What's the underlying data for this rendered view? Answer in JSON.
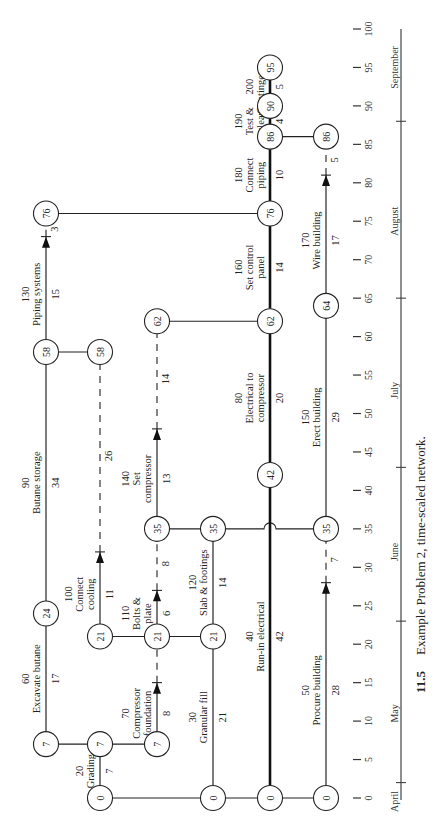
{
  "figure": {
    "number": "11.5",
    "caption": "Example Problem 2, time-scaled network.",
    "orientation": "rotated -90 degrees (reads bottom-to-top)"
  },
  "time_axis": {
    "ticks": [
      0,
      5,
      10,
      15,
      20,
      25,
      30,
      35,
      40,
      45,
      50,
      55,
      60,
      65,
      70,
      75,
      80,
      85,
      90,
      95,
      100
    ],
    "months": [
      {
        "label": "April",
        "tick_at": 2
      },
      {
        "label": "May",
        "tick_at": 23
      },
      {
        "label": "June",
        "tick_at": 43
      },
      {
        "label": "July",
        "tick_at": 65
      },
      {
        "label": "August",
        "tick_at": 88
      },
      {
        "label": "September",
        "tick_at": null
      }
    ],
    "month_label_positions": {
      "April": 0,
      "May": 11,
      "June": 32,
      "July": 53,
      "August": 75,
      "September": 95
    }
  },
  "rows": {
    "A": 46,
    "B": 100,
    "C": 157,
    "D": 213,
    "E": 270,
    "F": 326
  },
  "nodes": [
    {
      "id": "a0",
      "row": "B",
      "t": 0,
      "label": "0"
    },
    {
      "id": "d0",
      "row": "D",
      "t": 0,
      "label": "0"
    },
    {
      "id": "e0",
      "row": "E",
      "t": 0,
      "label": "0"
    },
    {
      "id": "f0",
      "row": "F",
      "t": 0,
      "label": "0"
    },
    {
      "id": "a7",
      "row": "A",
      "t": 7,
      "label": "7"
    },
    {
      "id": "b7",
      "row": "B",
      "t": 7,
      "label": "7"
    },
    {
      "id": "c7",
      "row": "C",
      "t": 7,
      "label": "7"
    },
    {
      "id": "a24",
      "row": "A",
      "t": 24,
      "label": "24"
    },
    {
      "id": "b21",
      "row": "B",
      "t": 21,
      "label": "21"
    },
    {
      "id": "c21",
      "row": "C",
      "t": 21,
      "label": "21"
    },
    {
      "id": "d21",
      "row": "D",
      "t": 21,
      "label": "21"
    },
    {
      "id": "c35",
      "row": "C",
      "t": 35,
      "label": "35"
    },
    {
      "id": "d35",
      "row": "D",
      "t": 35,
      "label": "35"
    },
    {
      "id": "f35",
      "row": "F",
      "t": 35,
      "label": "35"
    },
    {
      "id": "e42",
      "row": "E",
      "t": 42,
      "label": "42"
    },
    {
      "id": "a58",
      "row": "A",
      "t": 58,
      "label": "58"
    },
    {
      "id": "b58",
      "row": "B",
      "t": 58,
      "label": "58"
    },
    {
      "id": "c62",
      "row": "C",
      "t": 62,
      "label": "62"
    },
    {
      "id": "e62",
      "row": "E",
      "t": 62,
      "label": "62"
    },
    {
      "id": "f64",
      "row": "F",
      "t": 64,
      "label": "64"
    },
    {
      "id": "a76",
      "row": "A",
      "t": 76,
      "label": "76"
    },
    {
      "id": "e76",
      "row": "E",
      "t": 76,
      "label": "76"
    },
    {
      "id": "e86",
      "row": "E",
      "t": 86,
      "label": "86"
    },
    {
      "id": "f86",
      "row": "F",
      "t": 86,
      "label": "86"
    },
    {
      "id": "e90",
      "row": "E",
      "t": 90,
      "label": "90"
    },
    {
      "id": "e95",
      "row": "E",
      "t": 95,
      "label": "95"
    }
  ],
  "activities": [
    {
      "id": "20",
      "name": "Grading",
      "duration": "7",
      "row": "B",
      "t0": 0,
      "t1": 7,
      "arrow_at": 7,
      "critical": false,
      "label_lines": [
        "20",
        "Grading"
      ]
    },
    {
      "id": "60",
      "name": "Excavate butane",
      "duration": "17",
      "row": "A",
      "t0": 7,
      "t1": 24,
      "arrow_at": 24,
      "label_lines": [
        "60",
        "Excavate butane"
      ]
    },
    {
      "id": "70",
      "name": "Compressor foundation",
      "duration": "8",
      "row": "C",
      "t0": 7,
      "t1": 15,
      "arrow_at": 15,
      "float_to": 21,
      "label_lines": [
        "70",
        "Compressor",
        "foundation"
      ]
    },
    {
      "id": "30",
      "name": "Granular fill",
      "duration": "21",
      "row": "D",
      "t0": 0,
      "t1": 21,
      "arrow_at": 21,
      "label_lines": [
        "30",
        "Granular fill"
      ]
    },
    {
      "id": "40",
      "name": "Run-in electrical",
      "duration": "42",
      "row": "E",
      "t0": 0,
      "t1": 42,
      "arrow_at": 42,
      "critical": true,
      "label_lines": [
        "40",
        "Run-in electrical"
      ]
    },
    {
      "id": "50",
      "name": "Procure building",
      "duration": "28",
      "row": "F",
      "t0": 0,
      "t1": 28,
      "arrow_at": 28,
      "float_to": 35,
      "float_value": "7",
      "label_lines": [
        "50",
        "Procure building"
      ]
    },
    {
      "id": "90",
      "name": "Butane storage",
      "duration": "34",
      "row": "A",
      "t0": 24,
      "t1": 58,
      "arrow_at": 58,
      "label_lines": [
        "90",
        "Butane storage"
      ]
    },
    {
      "id": "100",
      "name": "Connect cooling",
      "duration": "11",
      "row": "B",
      "t0": 21,
      "t1": 32,
      "arrow_at": 32,
      "float_to": 58,
      "float_value": "26",
      "label_lines": [
        "100",
        "Connect",
        "cooling"
      ]
    },
    {
      "id": "110",
      "name": "Bolts & plate",
      "duration": "6",
      "row": "C",
      "t0": 21,
      "t1": 27,
      "arrow_at": 27,
      "float_to": 35,
      "float_value": "8",
      "label_lines": [
        "110",
        "Bolts &",
        "plate"
      ]
    },
    {
      "id": "120",
      "name": "Slab & footings",
      "duration": "14",
      "row": "D",
      "t0": 21,
      "t1": 35,
      "arrow_at": 35,
      "label_lines": [
        "120",
        "Slab & footings"
      ]
    },
    {
      "id": "140",
      "name": "Set compressor",
      "duration": "13",
      "row": "C",
      "t0": 35,
      "t1": 48,
      "arrow_at": 48,
      "float_to": 62,
      "float_value": "14",
      "label_lines": [
        "140",
        "Set",
        "compressor"
      ]
    },
    {
      "id": "80",
      "name": "Electrical to compressor",
      "duration": "20",
      "row": "E",
      "t0": 42,
      "t1": 62,
      "arrow_at": 62,
      "critical": true,
      "label_lines": [
        "80",
        "Electrical to",
        "compressor"
      ]
    },
    {
      "id": "150",
      "name": "Erect building",
      "duration": "29",
      "row": "F",
      "t0": 35,
      "t1": 64,
      "arrow_at": 64,
      "label_lines": [
        "150",
        "Erect building"
      ]
    },
    {
      "id": "130",
      "name": "Piping systems",
      "duration": "15",
      "row": "A",
      "t0": 58,
      "t1": 73,
      "arrow_at": 73,
      "float_to": 76,
      "float_value": "3",
      "label_lines": [
        "130",
        "Piping systems"
      ]
    },
    {
      "id": "160",
      "name": "Set control panel",
      "duration": "14",
      "row": "E",
      "t0": 62,
      "t1": 76,
      "arrow_at": 76,
      "critical": true,
      "label_lines": [
        "160",
        "Set control",
        "panel"
      ]
    },
    {
      "id": "170",
      "name": "Wire building",
      "duration": "17",
      "row": "F",
      "t0": 64,
      "t1": 81,
      "arrow_at": 81,
      "float_to": 86,
      "float_value": "5",
      "label_lines": [
        "170",
        "Wire building"
      ]
    },
    {
      "id": "180",
      "name": "Connect piping",
      "duration": "10",
      "row": "E",
      "t0": 76,
      "t1": 86,
      "arrow_at": 86,
      "critical": true,
      "label_lines": [
        "180",
        "Connect",
        "piping"
      ]
    },
    {
      "id": "190",
      "name": "Test & clean",
      "duration": "4",
      "row": "E",
      "t0": 86,
      "t1": 90,
      "arrow_at": 90,
      "critical": true,
      "label_lines": [
        "190",
        "Test &",
        "clean"
      ]
    },
    {
      "id": "200",
      "name": "Contingency",
      "duration": "5",
      "row": "E",
      "t0": 90,
      "t1": 95,
      "arrow_at": 95,
      "critical": true,
      "label_lines": [
        "200",
        "Contingency"
      ]
    }
  ],
  "connectors": [
    {
      "from_row": "B",
      "to_row": "F",
      "t": 0
    },
    {
      "from_row": "A",
      "to_row": "C",
      "t": 7
    },
    {
      "from_row": "B",
      "to_row": "D",
      "t": 21
    },
    {
      "from_row": "C",
      "to_row": "F",
      "t": 35,
      "hop_over": "E"
    },
    {
      "from_row": "A",
      "to_row": "B",
      "t": 58
    },
    {
      "from_row": "C",
      "to_row": "E",
      "t": 62
    },
    {
      "from_row": "A",
      "to_row": "E",
      "t": 76
    },
    {
      "from_row": "E",
      "to_row": "F",
      "t": 86
    }
  ]
}
